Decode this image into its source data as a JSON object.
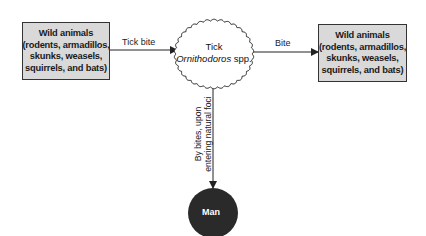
{
  "diagram": {
    "source_box": {
      "title": "Wild animals",
      "lines": [
        "(rodents, armadillos,",
        "skunks, weasels,",
        "squirrels, and bats)"
      ]
    },
    "vector": {
      "title": "Tick",
      "species": "Ornithodoros",
      "species_suffix": " spp."
    },
    "target_box": {
      "title": "Wild animals",
      "lines": [
        "(rodents, armadillos,",
        "skunks, weasels,",
        "squirrels, and bats)"
      ]
    },
    "host": {
      "label": "Man"
    },
    "edges": {
      "source_to_vector": "Tick bite",
      "vector_to_target": "Bite",
      "vector_to_host_line1": "By bites, upon",
      "vector_to_host_line2": "entering natural foci"
    },
    "colors": {
      "box_fill": "#d9d9d9",
      "box_border": "#333333",
      "host_fill": "#2a2a2a",
      "line": "#222222"
    }
  }
}
